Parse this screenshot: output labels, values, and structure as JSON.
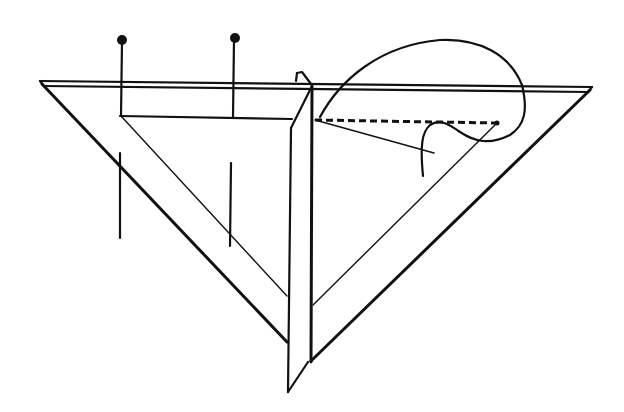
{
  "figure": {
    "description": "Line drawing: two triangular set squares with a vertical plate between them, two pins on the left square, a dashed line and a looped thread on the right square",
    "colors": {
      "ink": "#111111",
      "background": "#ffffff"
    },
    "elements": {
      "top_edge": "double straight edge across top",
      "left_set_square": "triangle with inner triangular cut-out",
      "right_set_square": "triangle with inner triangular cut-out",
      "vertical_plate": "thin vertical plate between the triangles",
      "pins": [
        "left pin",
        "right pin"
      ],
      "pin_shadows": [
        "left pin lower line",
        "right pin lower line"
      ],
      "dashed_line": "dashed line along top of right inner triangle",
      "thread": "looped thread curve"
    }
  }
}
